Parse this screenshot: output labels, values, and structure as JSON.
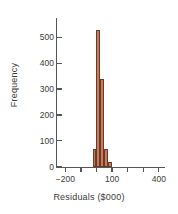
{
  "chart_data": {
    "type": "bar",
    "title": "",
    "subtitle": "",
    "xlabel": "Residuals ($000)",
    "ylabel": "Frequency",
    "xlim": [
      -260,
      440
    ],
    "ylim": [
      0,
      560
    ],
    "grid": false,
    "legend": null,
    "xticks": [
      -200,
      -100,
      0,
      100,
      200,
      300,
      400
    ],
    "xtick_labels": [
      "−200",
      "",
      "",
      "100",
      "",
      "",
      "400"
    ],
    "yticks": [
      0,
      100,
      200,
      300,
      400,
      500
    ],
    "ytick_labels": [
      "0",
      "100",
      "200",
      "300",
      "400",
      "500"
    ],
    "bin_width": 25,
    "bins": [
      {
        "x_left": -25,
        "x_right": 0,
        "value": 70
      },
      {
        "x_left": 0,
        "x_right": 25,
        "value": 530
      },
      {
        "x_left": 25,
        "x_right": 50,
        "value": 340
      },
      {
        "x_left": 50,
        "x_right": 75,
        "value": 70
      },
      {
        "x_left": 75,
        "x_right": 100,
        "value": 18
      }
    ],
    "categories": [
      "-25 to 0",
      "0 to 25",
      "25 to 50",
      "50 to 75",
      "75 to 100"
    ],
    "values": [
      70,
      530,
      340,
      70,
      18
    ],
    "colors": {
      "bar_fill": "#c87a5b",
      "bar_border": "#6b3b2a",
      "axis": "#555555",
      "text": "#3a3a3a",
      "background": "#ffffff"
    }
  }
}
